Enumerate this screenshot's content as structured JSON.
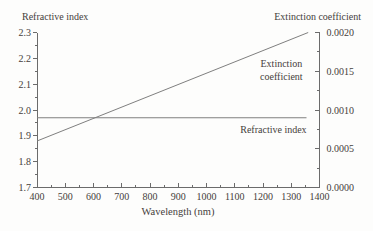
{
  "figure": {
    "left_axis_title": "Refractive index",
    "right_axis_title": "Extinction coefficient",
    "x_axis_title": "Wavelength (nm)"
  },
  "chart_data": {
    "type": "line",
    "title": "",
    "xlabel": "Wavelength (nm)",
    "ylabel_left": "Refractive index",
    "ylabel_right": "Extinction coefficient",
    "grid": false,
    "legend": "in-plot text annotations",
    "x_range": [
      400,
      1400
    ],
    "x_major_ticks": [
      400,
      500,
      600,
      700,
      800,
      900,
      1000,
      1100,
      1200,
      1300,
      1400
    ],
    "x_minor_tick_step": 50,
    "left_axis": {
      "range": [
        1.7,
        2.3
      ],
      "major_ticks": [
        1.7,
        1.8,
        1.9,
        2.0,
        2.1,
        2.2,
        2.3
      ],
      "tick_labels": [
        "1.7",
        "1.8",
        "1.9",
        "2.0",
        "2.1",
        "2.2",
        "2.3"
      ],
      "minor_tick_step": 0.05
    },
    "right_axis": {
      "range": [
        0.0,
        0.002
      ],
      "major_ticks": [
        0.0,
        0.0005,
        0.001,
        0.0015,
        0.002
      ],
      "tick_labels": [
        "0.0000",
        "0.0005",
        "0.0010",
        "0.0015",
        "0.0020"
      ],
      "minor_tick_step": 0.00025
    },
    "series": [
      {
        "name": "Refractive index",
        "axis": "left",
        "x": [
          400,
          1354
        ],
        "y": [
          1.97,
          1.97
        ]
      },
      {
        "name": "Extinction coefficient",
        "axis": "right",
        "x": [
          400,
          1360
        ],
        "y": [
          0.0006,
          0.002
        ]
      }
    ],
    "annotations": [
      {
        "id": "extinction",
        "lines": [
          "Extinction",
          "coefficient"
        ],
        "x": 1265,
        "y_left_axis": 2.16
      },
      {
        "id": "refractive",
        "lines": [
          "Refractive index"
        ],
        "x": 1237,
        "y_left_axis": 1.925
      }
    ],
    "colors": {
      "line": "#7f7f7f",
      "axis": "#6b6b6b",
      "text": "#45403b",
      "background": "#fdfdfc"
    }
  }
}
